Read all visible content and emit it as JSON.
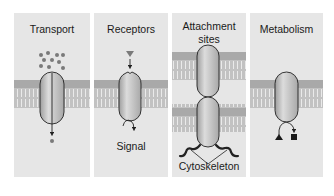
{
  "figure": {
    "panels": [
      {
        "id": "transport",
        "title": "Transport"
      },
      {
        "id": "receptors",
        "title": "Receptors",
        "annotation": "Signal"
      },
      {
        "id": "attachment",
        "title_line1": "Attachment",
        "title_line2": "sites",
        "annotation": "Cytoskeleton"
      },
      {
        "id": "metabolism",
        "title": "Metabolism"
      }
    ]
  },
  "colors": {
    "panel_bg": "#e6e6e6",
    "membrane": "#b8b8b8",
    "protein": "#c4c4c4",
    "ligand": "#7a7a7a",
    "outline": "#222222"
  }
}
